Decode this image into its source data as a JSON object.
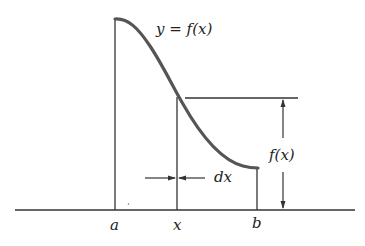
{
  "diagram": {
    "curve_label": "y = f(x)",
    "height_label": "f(x)",
    "width_label": "dx",
    "axis_labels": {
      "a": "a",
      "x": "x",
      "b": "b"
    },
    "colors": {
      "curve": "#555555",
      "lines": "#333333",
      "text": "#222222"
    }
  }
}
